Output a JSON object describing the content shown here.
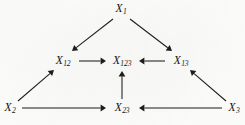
{
  "figure": {
    "type": "directed-graph",
    "background_color": "#fdfdfc",
    "ink_color": "#1d1d1d"
  },
  "nodes": [
    {
      "id": "X1",
      "base": "X",
      "subscript": "1",
      "label": "X1",
      "x": 121,
      "y": 9,
      "row": "top"
    },
    {
      "id": "X12",
      "base": "X",
      "subscript": "12",
      "label": "X12",
      "x": 63,
      "y": 61,
      "row": "middle"
    },
    {
      "id": "X123",
      "base": "X",
      "subscript": "123",
      "label": "X123",
      "x": 122,
      "y": 61,
      "row": "middle"
    },
    {
      "id": "X13",
      "base": "X",
      "subscript": "13",
      "label": "X13",
      "x": 181,
      "y": 61,
      "row": "middle"
    },
    {
      "id": "X2",
      "base": "X",
      "subscript": "2",
      "label": "X2",
      "x": 10,
      "y": 108,
      "row": "bottom"
    },
    {
      "id": "X23",
      "base": "X",
      "subscript": "23",
      "label": "X23",
      "x": 122,
      "y": 108,
      "row": "bottom"
    },
    {
      "id": "X3",
      "base": "X",
      "subscript": "3",
      "label": "X3",
      "x": 234,
      "y": 108,
      "row": "bottom"
    }
  ],
  "edges": [
    {
      "id": "e1",
      "from": "X1",
      "to": "X12",
      "name": "edge-x1-to-x12",
      "x1": 113,
      "y1": 19,
      "x2": 72,
      "y2": 51,
      "direction": "down-left"
    },
    {
      "id": "e2",
      "from": "X1",
      "to": "X13",
      "name": "edge-x1-to-x13",
      "x1": 130,
      "y1": 19,
      "x2": 172,
      "y2": 51,
      "direction": "down-right"
    },
    {
      "id": "e3",
      "from": "X12",
      "to": "X123",
      "name": "edge-x12-to-x123",
      "x1": 79,
      "y1": 61,
      "x2": 106,
      "y2": 61,
      "direction": "right"
    },
    {
      "id": "e4",
      "from": "X13",
      "to": "X123",
      "name": "edge-x13-to-x123",
      "x1": 165,
      "y1": 61,
      "x2": 139,
      "y2": 61,
      "direction": "left"
    },
    {
      "id": "e5",
      "from": "X2",
      "to": "X12",
      "name": "edge-x2-to-x12",
      "x1": 18,
      "y1": 101,
      "x2": 54,
      "y2": 70,
      "direction": "up-right"
    },
    {
      "id": "e6",
      "from": "X3",
      "to": "X13",
      "name": "edge-x3-to-x13",
      "x1": 226,
      "y1": 101,
      "x2": 190,
      "y2": 70,
      "direction": "up-left"
    },
    {
      "id": "e7",
      "from": "X23",
      "to": "X123",
      "name": "edge-x23-to-x123",
      "x1": 122,
      "y1": 99,
      "x2": 122,
      "y2": 71,
      "direction": "up"
    },
    {
      "id": "e8",
      "from": "X2",
      "to": "X23",
      "name": "edge-x2-to-x23",
      "x1": 22,
      "y1": 108,
      "x2": 106,
      "y2": 108,
      "direction": "right"
    },
    {
      "id": "e9",
      "from": "X3",
      "to": "X23",
      "name": "edge-x3-to-x23",
      "x1": 222,
      "y1": 108,
      "x2": 139,
      "y2": 108,
      "direction": "left"
    }
  ]
}
